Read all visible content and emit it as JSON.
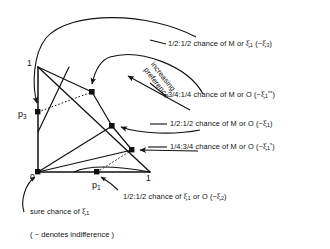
{
  "figure": {
    "type": "marschak-machina-probability-triangle",
    "note": "( ~ denotes indifference )",
    "preference_label_line1": "increasing",
    "preference_label_line2": "preference",
    "axes": {
      "y_top": "1",
      "origin": "0",
      "x_right": "1"
    },
    "point_labels": {
      "p1": "p",
      "p1_sub": "1",
      "p3": "p",
      "p3_sub": "3"
    },
    "annotations": [
      {
        "id": "xi3",
        "ratio": "1/2:1/2",
        "text_pre": "1/2:1/2  chance of M or ",
        "outcome": "ξ",
        "outcome_sub": "1",
        "tail_open": " (~",
        "equiv": "ξ",
        "equiv_sub": "3",
        "equiv_sup": "",
        "tail_close": ")",
        "full": "1/2:1/2 chance of M or ξ1 (~ξ3)"
      },
      {
        "id": "xi1starstar",
        "ratio": "3/4:1/4",
        "text_pre": "3/4:1/4  chance of M or O (~",
        "outcome": "O",
        "equiv": "ξ",
        "equiv_sub": "1",
        "equiv_sup": "**",
        "tail_close": ")",
        "full": "3/4:1/4 chance of M or O (~ξ1**)"
      },
      {
        "id": "xi1",
        "ratio": "1/2:1/2",
        "text_pre": "1/2:1/2  chance of M or O (~",
        "outcome": "O",
        "equiv": "ξ",
        "equiv_sub": "1",
        "equiv_sup": "",
        "tail_close": ")",
        "full": "1/2:1/2 chance of M or O (~ξ1)"
      },
      {
        "id": "xi1star",
        "ratio": "1/4:3/4",
        "text_pre": "1/4:3/4  chance of M or O (~",
        "outcome": "O",
        "equiv": "ξ",
        "equiv_sub": "1",
        "equiv_sup": "*",
        "tail_close": ")",
        "full": "1/4:3/4 chance of M or O (~ξ1*)"
      },
      {
        "id": "xi2",
        "ratio": "1/2:1/2",
        "text_pre": "1/2:1/2 chance of ",
        "outcome": "ξ",
        "outcome_sub": "1",
        "mid": " or O (~",
        "equiv": "ξ",
        "equiv_sub": "2",
        "tail_close": ")",
        "full": "1/2:1/2 chance of ξ1 or O (~ξ2)"
      },
      {
        "id": "sure",
        "text_pre": "sure  chance of ",
        "equiv": "ξ",
        "equiv_sub": "1",
        "full": "sure chance of ξ1"
      }
    ],
    "colors": {
      "ink": "#111111",
      "background": "#ffffff"
    }
  }
}
